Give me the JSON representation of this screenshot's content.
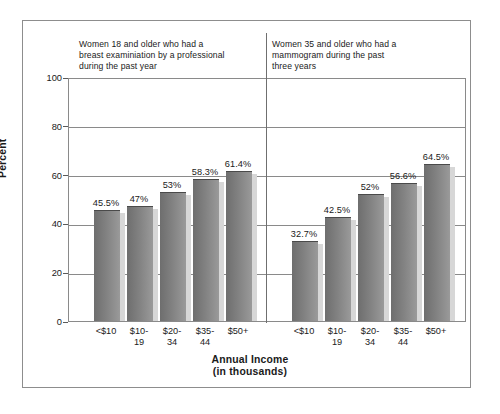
{
  "chart_data": {
    "type": "bar",
    "title": "",
    "xlabel": "Annual Income\n(in thousands)",
    "ylabel": "Percent",
    "ylim": [
      0,
      100
    ],
    "yticks": [
      0,
      20,
      40,
      60,
      80,
      100
    ],
    "ytick_labels": [
      "0",
      "20",
      "40",
      "60",
      "80",
      "100"
    ],
    "grid": true,
    "legend": "none",
    "categories": [
      "<$10",
      "$10-\n19",
      "$20-\n34",
      "$35-\n44",
      "$50+"
    ],
    "panels": [
      {
        "name": "breast-examination",
        "title": "Women 18 and older who had a\nbreast examiniation by a professional\nduring the past year",
        "values": [
          45.5,
          47,
          53,
          58.3,
          61.4
        ],
        "value_labels": [
          "45.5%",
          "47%",
          "53%",
          "58.3%",
          "61.4%"
        ]
      },
      {
        "name": "mammogram",
        "title": "Women 35 and older who had a\nmammogram during the past\nthree years",
        "values": [
          32.7,
          42.5,
          52,
          56.6,
          64.5
        ],
        "value_labels": [
          "32.7%",
          "42.5%",
          "52%",
          "56.6%",
          "64.5%"
        ]
      }
    ],
    "colors": {
      "bar_dark": "#6e6e6e",
      "bar_light": "#9a9a9a",
      "bar_shadow": "#d7d7d7",
      "axis": "#8a8a8a",
      "divider": "#6f6f6f",
      "frame": "#8d8d8d",
      "text": "#1a1a1a",
      "background": "#ffffff"
    }
  }
}
